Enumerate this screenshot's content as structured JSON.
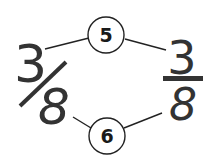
{
  "diagram": {
    "left_fraction": {
      "numerator": "3",
      "denominator": "8",
      "style": "slash"
    },
    "right_fraction": {
      "numerator": "3",
      "denominator": "8",
      "style": "bar"
    },
    "top_node": {
      "label": "5"
    },
    "bottom_node": {
      "label": "6"
    }
  },
  "colors": {
    "ink": "#333333",
    "background": "#ffffff"
  }
}
